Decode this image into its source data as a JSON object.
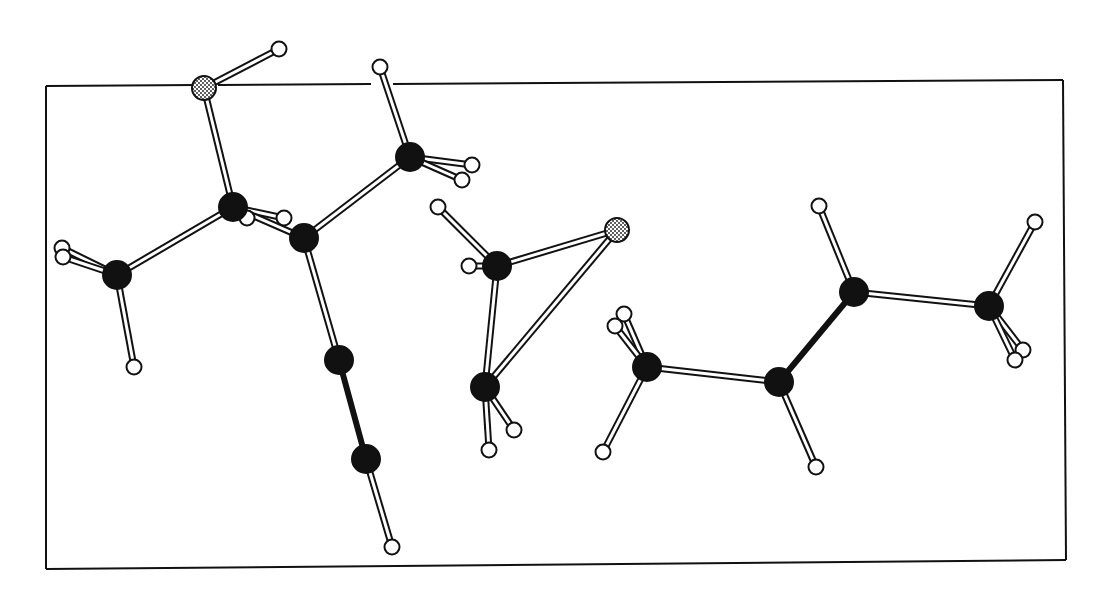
{
  "diagram": {
    "type": "ball-and-stick molecular structure",
    "colors": {
      "background": "#ffffff",
      "ink": "#111111",
      "carbon": "#111111",
      "hydrogen": "#ffffff",
      "heteroatom_fill": "#ffffff"
    },
    "frame": {
      "corners": [
        [
          46,
          86
        ],
        [
          1063,
          80
        ],
        [
          1066,
          560
        ],
        [
          46,
          569
        ]
      ],
      "gaps": [
        [
          197,
          218
        ],
        [
          371,
          393
        ]
      ]
    },
    "atom_radius": {
      "C": 14,
      "H": 7.5,
      "X": 12
    },
    "atoms": [
      {
        "id": "X1",
        "el": "X",
        "x": 204,
        "y": 88
      },
      {
        "id": "H1",
        "el": "H",
        "x": 279,
        "y": 49
      },
      {
        "id": "C1",
        "el": "C",
        "x": 233,
        "y": 207
      },
      {
        "id": "H2",
        "el": "H",
        "x": 247,
        "y": 218
      },
      {
        "id": "H3",
        "el": "H",
        "x": 284,
        "y": 218
      },
      {
        "id": "C2",
        "el": "C",
        "x": 304,
        "y": 238
      },
      {
        "id": "C3",
        "el": "C",
        "x": 117,
        "y": 275
      },
      {
        "id": "H4",
        "el": "H",
        "x": 62,
        "y": 248
      },
      {
        "id": "H5",
        "el": "H",
        "x": 63,
        "y": 257
      },
      {
        "id": "H6",
        "el": "H",
        "x": 134,
        "y": 367
      },
      {
        "id": "C4",
        "el": "C",
        "x": 410,
        "y": 157
      },
      {
        "id": "H7",
        "el": "H",
        "x": 380,
        "y": 67
      },
      {
        "id": "H8",
        "el": "H",
        "x": 472,
        "y": 165
      },
      {
        "id": "H9",
        "el": "H",
        "x": 462,
        "y": 180
      },
      {
        "id": "C5",
        "el": "C",
        "x": 339,
        "y": 360
      },
      {
        "id": "C6",
        "el": "C",
        "x": 366,
        "y": 459
      },
      {
        "id": "H10",
        "el": "H",
        "x": 392,
        "y": 547
      },
      {
        "id": "C7",
        "el": "C",
        "x": 497,
        "y": 266
      },
      {
        "id": "H11",
        "el": "H",
        "x": 438,
        "y": 207
      },
      {
        "id": "H12",
        "el": "H",
        "x": 469,
        "y": 266
      },
      {
        "id": "X2",
        "el": "X",
        "x": 617,
        "y": 230
      },
      {
        "id": "C8",
        "el": "C",
        "x": 485,
        "y": 387
      },
      {
        "id": "H13",
        "el": "H",
        "x": 489,
        "y": 450
      },
      {
        "id": "H14",
        "el": "H",
        "x": 514,
        "y": 430
      },
      {
        "id": "C9",
        "el": "C",
        "x": 647,
        "y": 367
      },
      {
        "id": "H15",
        "el": "H",
        "x": 624,
        "y": 314
      },
      {
        "id": "H16",
        "el": "H",
        "x": 615,
        "y": 326
      },
      {
        "id": "H17",
        "el": "H",
        "x": 603,
        "y": 452
      },
      {
        "id": "C10",
        "el": "C",
        "x": 779,
        "y": 382
      },
      {
        "id": "H18",
        "el": "H",
        "x": 816,
        "y": 467
      },
      {
        "id": "C11",
        "el": "C",
        "x": 854,
        "y": 292
      },
      {
        "id": "H19",
        "el": "H",
        "x": 819,
        "y": 206
      },
      {
        "id": "C12",
        "el": "C",
        "x": 989,
        "y": 306
      },
      {
        "id": "H20",
        "el": "H",
        "x": 1035,
        "y": 222
      },
      {
        "id": "H21",
        "el": "H",
        "x": 1023,
        "y": 350
      },
      {
        "id": "H22",
        "el": "H",
        "x": 1015,
        "y": 360
      }
    ],
    "bonds": [
      {
        "a": "X1",
        "b": "H1",
        "style": "open"
      },
      {
        "a": "X1",
        "b": "C1",
        "style": "open"
      },
      {
        "a": "C1",
        "b": "C3",
        "style": "open"
      },
      {
        "a": "C1",
        "b": "H3",
        "style": "open"
      },
      {
        "a": "C1",
        "b": "C2",
        "style": "open"
      },
      {
        "a": "C3",
        "b": "H4",
        "style": "open"
      },
      {
        "a": "C3",
        "b": "H5",
        "style": "open"
      },
      {
        "a": "C3",
        "b": "H6",
        "style": "open"
      },
      {
        "a": "C2",
        "b": "C4",
        "style": "open"
      },
      {
        "a": "C4",
        "b": "H7",
        "style": "open"
      },
      {
        "a": "C4",
        "b": "H8",
        "style": "open"
      },
      {
        "a": "C4",
        "b": "H9",
        "style": "open"
      },
      {
        "a": "C2",
        "b": "C5",
        "style": "open"
      },
      {
        "a": "C5",
        "b": "C6",
        "style": "solid"
      },
      {
        "a": "C6",
        "b": "H10",
        "style": "open"
      },
      {
        "a": "C7",
        "b": "H11",
        "style": "open"
      },
      {
        "a": "C7",
        "b": "H12",
        "style": "open"
      },
      {
        "a": "C7",
        "b": "X2",
        "style": "open"
      },
      {
        "a": "C7",
        "b": "C8",
        "style": "open"
      },
      {
        "a": "C8",
        "b": "X2",
        "style": "open"
      },
      {
        "a": "C8",
        "b": "H13",
        "style": "open"
      },
      {
        "a": "C8",
        "b": "H14",
        "style": "open"
      },
      {
        "a": "C9",
        "b": "H15",
        "style": "open"
      },
      {
        "a": "C9",
        "b": "H16",
        "style": "open"
      },
      {
        "a": "C9",
        "b": "H17",
        "style": "open"
      },
      {
        "a": "C9",
        "b": "C10",
        "style": "open"
      },
      {
        "a": "C10",
        "b": "H18",
        "style": "open"
      },
      {
        "a": "C10",
        "b": "C11",
        "style": "solid"
      },
      {
        "a": "C11",
        "b": "H19",
        "style": "open"
      },
      {
        "a": "C11",
        "b": "C12",
        "style": "open"
      },
      {
        "a": "C12",
        "b": "H20",
        "style": "open"
      },
      {
        "a": "C12",
        "b": "H21",
        "style": "open"
      },
      {
        "a": "C12",
        "b": "H22",
        "style": "open"
      }
    ],
    "molecules": [
      {
        "name": "molecule-left-branched",
        "atoms": [
          "X1",
          "H1",
          "C1",
          "H2",
          "H3",
          "C2",
          "C3",
          "H4",
          "H5",
          "H6",
          "C4",
          "H7",
          "H8",
          "H9",
          "C5",
          "C6",
          "H10"
        ]
      },
      {
        "name": "molecule-middle-three-ring",
        "atoms": [
          "C7",
          "H11",
          "H12",
          "X2",
          "C8",
          "H13",
          "H14"
        ]
      },
      {
        "name": "molecule-right-chain",
        "atoms": [
          "C9",
          "H15",
          "H16",
          "H17",
          "C10",
          "H18",
          "C11",
          "H19",
          "C12",
          "H20",
          "H21",
          "H22"
        ]
      }
    ]
  }
}
